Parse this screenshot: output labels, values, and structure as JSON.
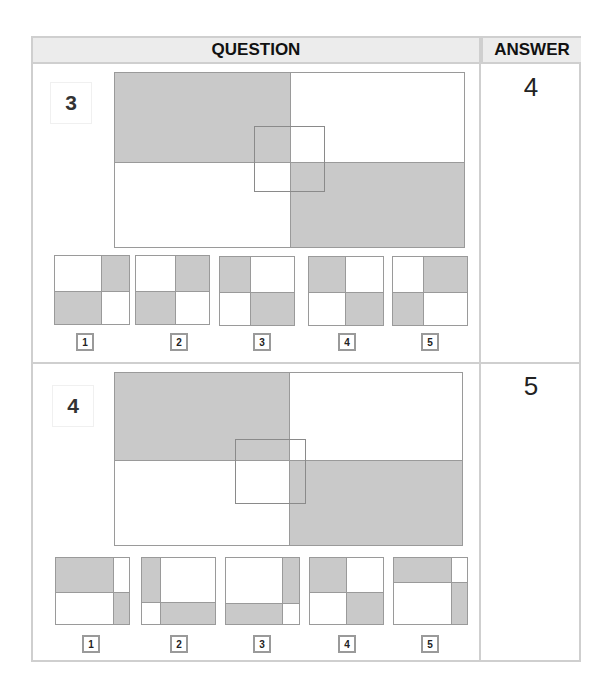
{
  "header": {
    "question_label": "QUESTION",
    "answer_label": "ANSWER"
  },
  "colors": {
    "shade": "#c9c9c9",
    "border": "#cfcfcf",
    "line": "#9a9a9a"
  },
  "questions": [
    {
      "number": "3",
      "answer": "4",
      "figure": {
        "description": "large rectangle divided into quadrants: top-left shaded, bottom-right shaded; small overlay square at center",
        "shaded_quadrants": [
          "top-left",
          "bottom-right"
        ]
      },
      "options": [
        {
          "label": "1",
          "pattern": "top-right and bottom-left shaded"
        },
        {
          "label": "2",
          "pattern": "top-right and bottom-left shaded"
        },
        {
          "label": "3",
          "pattern": "top-left and bottom-right shaded (narrow left column)"
        },
        {
          "label": "4",
          "pattern": "top-left and bottom-right shaded"
        },
        {
          "label": "5",
          "pattern": "top-right and bottom-left shaded (narrow left column)"
        }
      ]
    },
    {
      "number": "4",
      "answer": "5",
      "figure": {
        "description": "large rectangle divided into quadrants: top-left shaded, bottom-right shaded; small overlay square offset left of center",
        "shaded_quadrants": [
          "top-left",
          "bottom-right"
        ]
      },
      "options": [
        {
          "label": "1",
          "pattern": "top-left and bottom-right shaded (narrow right column)"
        },
        {
          "label": "2",
          "pattern": "top-left and bottom-right shaded (narrow left column, low split)"
        },
        {
          "label": "3",
          "pattern": "top-right and bottom-left shaded (narrow right column, low split)"
        },
        {
          "label": "4",
          "pattern": "top-left and bottom-right shaded"
        },
        {
          "label": "5",
          "pattern": "top-left and bottom-right shaded (narrow right column, high split)"
        }
      ]
    }
  ]
}
